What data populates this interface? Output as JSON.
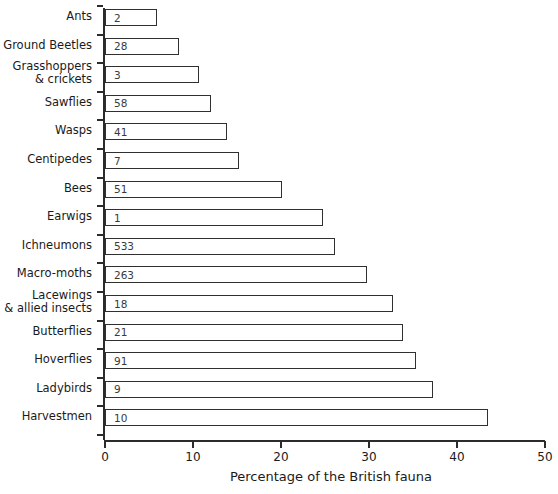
{
  "chart_data": {
    "type": "bar",
    "orientation": "horizontal",
    "title": "",
    "xlabel": "Percentage of the British fauna",
    "ylabel": "",
    "xlim": [
      0,
      50
    ],
    "xticks": [
      0,
      10,
      20,
      30,
      40,
      50
    ],
    "grid": false,
    "legend": null,
    "categories": [
      "Ants",
      "Ground Beetles",
      "Grasshoppers\n& crickets",
      "Sawflies",
      "Wasps",
      "Centipedes",
      "Bees",
      "Earwigs",
      "Ichneumons",
      "Macro-moths",
      "Lacewings\n& allied insects",
      "Butterflies",
      "Hoverflies",
      "Ladybirds",
      "Harvestmen"
    ],
    "values": [
      5.9,
      8.4,
      10.7,
      12.0,
      13.9,
      15.2,
      20.1,
      24.8,
      26.1,
      29.8,
      32.7,
      33.9,
      35.3,
      37.3,
      43.5
    ],
    "bar_labels": [
      "2",
      "28",
      "3",
      "58",
      "41",
      "7",
      "51",
      "1",
      "533",
      "263",
      "18",
      "21",
      "91",
      "9",
      "10"
    ],
    "series": [
      {
        "name": "Percentage of the British fauna",
        "values": [
          5.9,
          8.4,
          10.7,
          12.0,
          13.9,
          15.2,
          20.1,
          24.8,
          26.1,
          29.8,
          32.7,
          33.9,
          35.3,
          37.3,
          43.5
        ]
      }
    ],
    "colors": {
      "bar_fill": "#ffffff",
      "bar_edge": "#303030",
      "axis": "#2b2b2b",
      "text": "#1a1a1a",
      "value_text": "#3a3a3a"
    }
  }
}
